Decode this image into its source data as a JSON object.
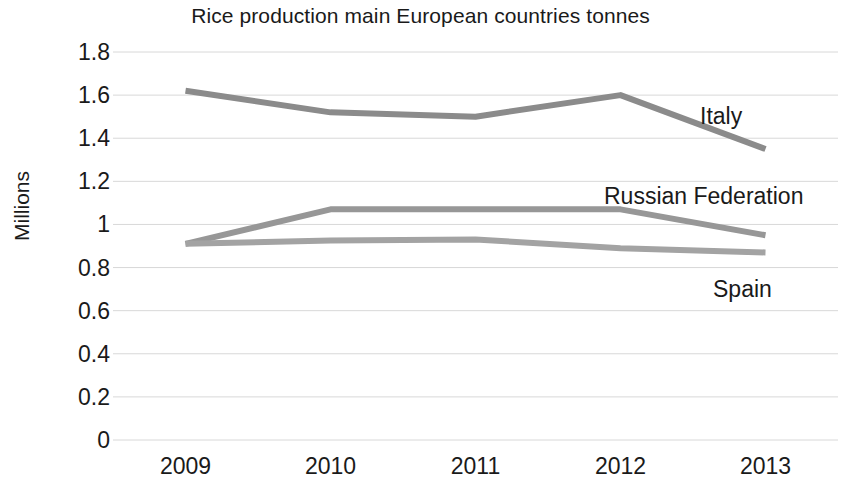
{
  "chart_data": {
    "type": "line",
    "title": "Rice production main European countries tonnes",
    "xlabel": "",
    "ylabel": "Millions",
    "categories": [
      "2009",
      "2010",
      "2011",
      "2012",
      "2013"
    ],
    "x": [
      2009,
      2010,
      2011,
      2012,
      2013
    ],
    "ylim": [
      0,
      1.8
    ],
    "yticks": [
      "0",
      "0.2",
      "0.4",
      "0.6",
      "0.8",
      "1",
      "1.2",
      "1.4",
      "1.6",
      "1.8"
    ],
    "ytick_values": [
      0,
      0.2,
      0.4,
      0.6,
      0.8,
      1,
      1.2,
      1.4,
      1.6,
      1.8
    ],
    "grid": "horizontal",
    "legend": "inline-annotations",
    "series": [
      {
        "name": "Italy",
        "color": "#8b8b8b",
        "values": [
          1.62,
          1.52,
          1.5,
          1.6,
          1.35
        ],
        "label_x": 700,
        "label_y": 103
      },
      {
        "name": "Russian Federation",
        "color": "#979797",
        "values": [
          0.91,
          1.07,
          1.07,
          1.07,
          0.95
        ],
        "label_x": 604,
        "label_y": 183
      },
      {
        "name": "Spain",
        "color": "#a3a3a3",
        "values": [
          0.91,
          0.925,
          0.93,
          0.89,
          0.87
        ],
        "label_x": 713,
        "label_y": 276
      }
    ]
  },
  "colors": {
    "background": "#ffffff",
    "text": "#1a1a1a",
    "gridline": "#d8d8d8"
  }
}
